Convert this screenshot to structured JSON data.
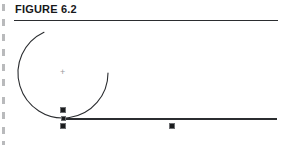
{
  "page": {
    "width": 287,
    "height": 145,
    "background": "#ffffff",
    "ink_color": "#2b2d30",
    "handle_color": "#1b1c1e",
    "margin_artifact_color": "#b9babc"
  },
  "header": {
    "title": "FIGURE 6.2",
    "rule": {
      "x": 14,
      "y": 20,
      "width": 264,
      "height": 1,
      "color": "#2b2d30"
    }
  },
  "drawing": {
    "description": "Drafting diagram: a large open arc tangent to a horizontal base line, shown with CAD selection handles and a center point marker.",
    "arc": {
      "name": "tangent-arc",
      "center_x": 63,
      "center_y": 73,
      "radius": 45,
      "start_angle_deg": 90,
      "end_angle_deg": 335,
      "stroke": "#2b2d30",
      "stroke_width": 1.1,
      "open_side": "upper-right"
    },
    "arc_endpoint": {
      "x": 105,
      "y": 52
    },
    "arc_tangent_point": {
      "x": 63,
      "y": 118
    },
    "baseline": {
      "name": "horizontal-base-line",
      "x1": 63,
      "y1": 119,
      "x2": 277,
      "y2": 119,
      "stroke": "#2b2d30",
      "stroke_width": 2
    },
    "center_marker": {
      "x": 63,
      "y": 73,
      "glyph": "+",
      "color": "#9a9b9e"
    },
    "handles": [
      {
        "name": "handle-arc-tangent-upper",
        "x": 63,
        "y": 110,
        "size": 6
      },
      {
        "name": "handle-line-start",
        "x": 63,
        "y": 118,
        "size": 5
      },
      {
        "name": "handle-line-start-lower",
        "x": 63,
        "y": 126,
        "size": 6
      },
      {
        "name": "handle-line-midpoint",
        "x": 172,
        "y": 126,
        "size": 6
      }
    ],
    "margin_ticks_y": [
      4,
      19,
      34,
      49,
      64,
      79,
      97,
      112,
      127,
      141
    ]
  }
}
